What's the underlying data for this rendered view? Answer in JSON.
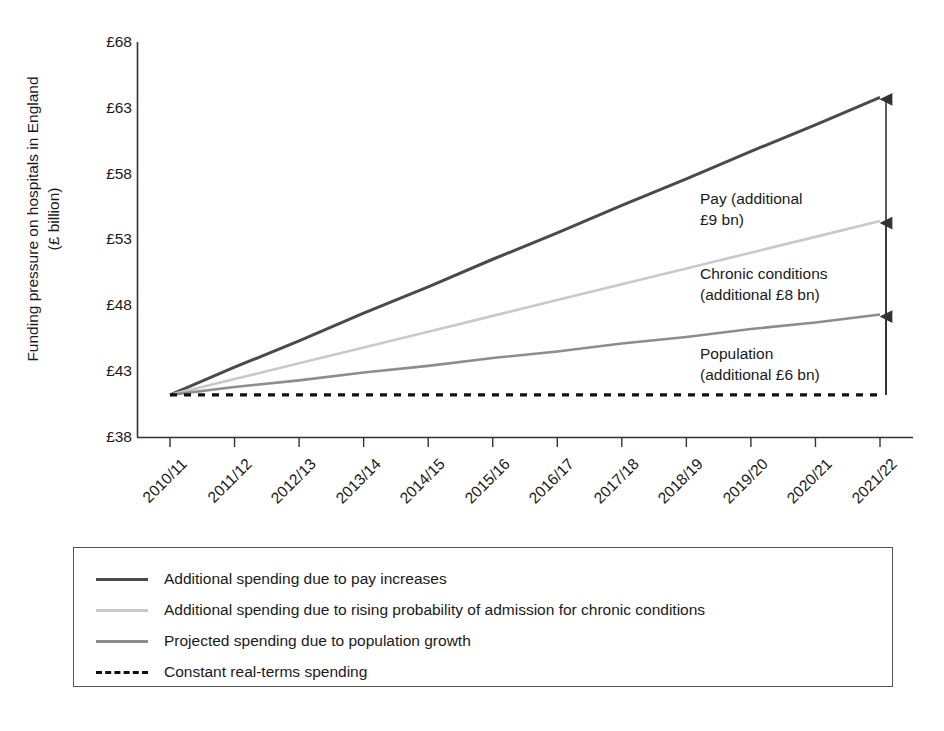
{
  "chart_data": {
    "type": "line",
    "title": "",
    "xlabel": "",
    "ylabel": "Funding pressure on hospitals in England",
    "ylabel_line2": "(£ billion)",
    "ylabel_unit": "£ billion",
    "categories": [
      "2010/11",
      "2011/12",
      "2012/13",
      "2013/14",
      "2014/15",
      "2015/16",
      "2016/17",
      "2017/18",
      "2018/19",
      "2019/20",
      "2020/21",
      "2021/22"
    ],
    "ylim": [
      38,
      68
    ],
    "yticks": [
      38,
      43,
      48,
      53,
      58,
      63,
      68
    ],
    "ytick_labels": [
      "£38",
      "£43",
      "£48",
      "£53",
      "£58",
      "£63",
      "£68"
    ],
    "grid": false,
    "legend_position": "below-plot",
    "series": [
      {
        "name": "Additional spending due to pay increases",
        "key": "pay",
        "color": "#4a4a4a",
        "style": "solid",
        "width": 3,
        "values": [
          41.2,
          43.3,
          45.3,
          47.4,
          49.4,
          51.5,
          53.5,
          55.6,
          57.6,
          59.7,
          61.7,
          63.8
        ]
      },
      {
        "name": "Additional spending due to rising probability of admission for chronic conditions",
        "key": "chronic",
        "color": "#c9c9c9",
        "style": "solid",
        "width": 2.6,
        "values": [
          41.2,
          42.4,
          43.6,
          44.8,
          46.0,
          47.2,
          48.4,
          49.6,
          50.8,
          52.0,
          53.2,
          54.4
        ]
      },
      {
        "name": "Projected spending due to population growth",
        "key": "population",
        "color": "#8d8d8d",
        "style": "solid",
        "width": 2.6,
        "values": [
          41.2,
          41.8,
          42.3,
          42.9,
          43.4,
          44.0,
          44.5,
          45.1,
          45.6,
          46.2,
          46.7,
          47.3
        ]
      },
      {
        "name": "Constant real-terms spending",
        "key": "constant",
        "color": "#111111",
        "style": "dashed",
        "width": 3.4,
        "values": [
          41.2,
          41.2,
          41.2,
          41.2,
          41.2,
          41.2,
          41.2,
          41.2,
          41.2,
          41.2,
          41.2,
          41.2
        ]
      }
    ],
    "annotations": [
      {
        "key": "pay",
        "line1": "Pay (additional",
        "line2": "£9 bn)",
        "amount": "£9 bn"
      },
      {
        "key": "chronic",
        "line1": "Chronic conditions",
        "line2": "(additional £8 bn)",
        "amount": "£8 bn"
      },
      {
        "key": "population",
        "line1": "Population",
        "line2": "(additional £6 bn)",
        "amount": "£6 bn"
      }
    ]
  },
  "axis": {
    "y_title_line1": "Funding pressure on hospitals in England",
    "y_title_line2": "(£ billion)",
    "ytick_labels": [
      "£68",
      "£63",
      "£58",
      "£53",
      "£48",
      "£43",
      "£38"
    ],
    "xtick_labels": [
      "2010/11",
      "2011/12",
      "2012/13",
      "2013/14",
      "2014/15",
      "2015/16",
      "2016/17",
      "2017/18",
      "2018/19",
      "2019/20",
      "2020/21",
      "2021/22"
    ]
  },
  "annotations": {
    "pay_l1": "Pay (additional",
    "pay_l2": "£9 bn)",
    "chronic_l1": "Chronic conditions",
    "chronic_l2": "(additional £8 bn)",
    "population_l1": "Population",
    "population_l2": "(additional £6 bn)"
  },
  "legend": {
    "items": [
      {
        "label": "Additional spending due to pay increases",
        "color": "#4a4a4a",
        "style": "solid"
      },
      {
        "label": "Additional spending due to rising probability of admission for chronic conditions",
        "color": "#c9c9c9",
        "style": "solid"
      },
      {
        "label": "Projected spending due to population growth",
        "color": "#8d8d8d",
        "style": "solid"
      },
      {
        "label": "Constant real-terms spending",
        "color": "#111111",
        "style": "dashed"
      }
    ]
  },
  "colors": {
    "pay": "#4a4a4a",
    "chronic": "#c9c9c9",
    "population": "#8d8d8d",
    "constant": "#111111",
    "axis": "#333333",
    "text": "#1a1a1a"
  }
}
